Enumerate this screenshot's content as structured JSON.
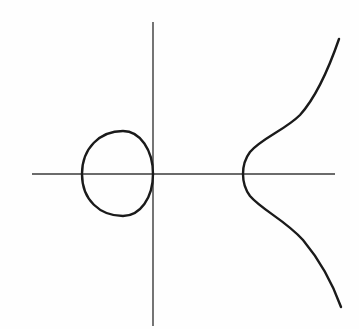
{
  "diagram": {
    "title": "",
    "colors": {
      "background": "#fefefe",
      "axis": "#3a3a3a",
      "curve": "#1a1a1a"
    },
    "axes": {
      "x_axis": {
        "x1": 32,
        "y1": 174,
        "x2": 335,
        "y2": 174
      },
      "y_axis": {
        "x1": 153,
        "y1": 22,
        "x2": 153,
        "y2": 326
      }
    },
    "components": [
      {
        "name": "oval",
        "path": "M 82 174 C 82 148, 100 131, 123 131 C 140 131, 153 150, 153 174 C 153 198, 140 216, 123 216 C 100 216, 82 200, 82 174 Z"
      },
      {
        "name": "unbounded-branch",
        "path": "M 339 39 C 330 65, 318 95, 300 115 C 285 130, 262 138, 250 152 C 244 160, 243 168, 243 174 C 243 180, 244 188, 250 196 C 262 210, 285 220, 303 240 C 318 258, 332 282, 341 307"
      }
    ]
  }
}
